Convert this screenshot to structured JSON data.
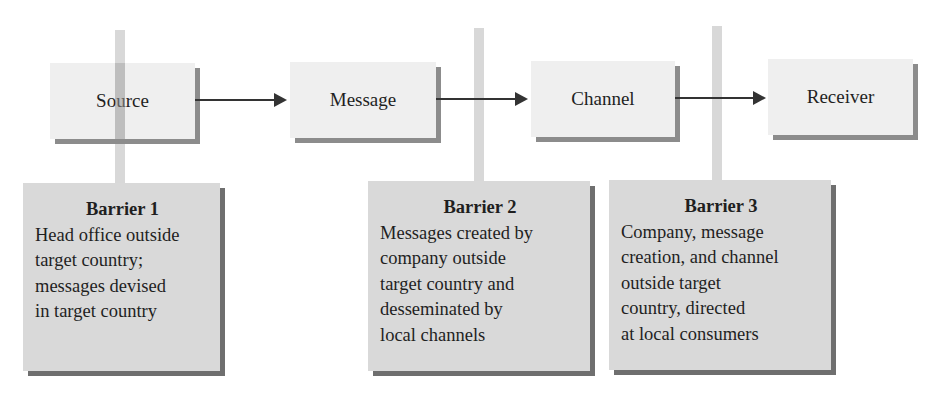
{
  "diagram": {
    "flow": [
      {
        "id": "source",
        "label": "Source"
      },
      {
        "id": "message",
        "label": "Message"
      },
      {
        "id": "channel",
        "label": "Channel"
      },
      {
        "id": "receiver",
        "label": "Receiver"
      }
    ],
    "barriers": [
      {
        "title": "Barrier 1",
        "lines": [
          "Head office outside",
          "target country;",
          "messages devised",
          "in target country"
        ]
      },
      {
        "title": "Barrier 2",
        "lines": [
          "Messages created by",
          "company outside",
          "target country and",
          "desseminated by",
          "local channels"
        ]
      },
      {
        "title": "Barrier 3",
        "lines": [
          "Company, message",
          "creation, and channel",
          "outside target",
          "country, directed",
          "at local consumers"
        ]
      }
    ],
    "colors": {
      "top_box_fill": "#efefef",
      "top_box_shadow": "#8c8c8c",
      "barrier_fill": "#d9d9d9",
      "barrier_shadow": "#6f6f6f",
      "connector_bar": "#d8d8d8",
      "arrow": "#333333"
    }
  }
}
